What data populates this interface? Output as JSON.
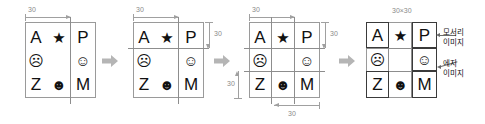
{
  "figure": {
    "type": "diagram",
    "grid_symbols": [
      [
        "A",
        "★",
        "P"
      ],
      [
        "☹",
        "",
        "☺"
      ],
      [
        "Z",
        "☻",
        "M"
      ]
    ],
    "colors": {
      "grid_line": "#9a9a9a",
      "dim_line": "#a0a0a0",
      "dim_text": "#8a8a8a",
      "glyph": "#111111",
      "highlight_border": "#3a3a3a",
      "leader": "#6a6a6a",
      "background": "#ffffff"
    }
  },
  "panels": [
    {
      "id": "panel-1",
      "name": "single-vertical-split",
      "dims": [
        {
          "id": "p1-top-30",
          "label": "30",
          "orientation": "horizontal",
          "position": "top-left"
        }
      ]
    },
    {
      "id": "panel-2",
      "name": "vertical-and-horizontal-split",
      "dims": [
        {
          "id": "p2-top-30",
          "label": "30",
          "orientation": "horizontal",
          "position": "top-left"
        },
        {
          "id": "p2-right-30",
          "label": "30",
          "orientation": "vertical",
          "position": "right-top"
        }
      ]
    },
    {
      "id": "panel-3",
      "name": "full-three-by-three-grid",
      "dims": [
        {
          "id": "p3-top-30",
          "label": "30",
          "orientation": "horizontal",
          "position": "top-left"
        },
        {
          "id": "p3-right-30",
          "label": "30",
          "orientation": "vertical",
          "position": "right-top"
        },
        {
          "id": "p3-left-30",
          "label": "30",
          "orientation": "vertical",
          "position": "left-bottom"
        },
        {
          "id": "p3-bottom-30",
          "label": "30",
          "orientation": "horizontal",
          "position": "bottom-right"
        }
      ]
    },
    {
      "id": "panel-4",
      "name": "labelled-tiles",
      "size_caption": "30×30",
      "highlighted_cells": [
        "A",
        "P",
        "Z",
        "M"
      ],
      "callouts": [
        {
          "id": "corner-callout",
          "lines": [
            "모서리",
            "이미지"
          ],
          "target_cell": "P"
        },
        {
          "id": "edge-callout",
          "lines": [
            "에지",
            "이미지"
          ],
          "target_cell": "☺"
        }
      ]
    }
  ],
  "flow_arrows": [
    {
      "id": "arrow-1",
      "from": "panel-1",
      "to": "panel-2"
    },
    {
      "id": "arrow-2",
      "from": "panel-2",
      "to": "panel-3"
    },
    {
      "id": "arrow-3",
      "from": "panel-3",
      "to": "panel-4"
    }
  ]
}
